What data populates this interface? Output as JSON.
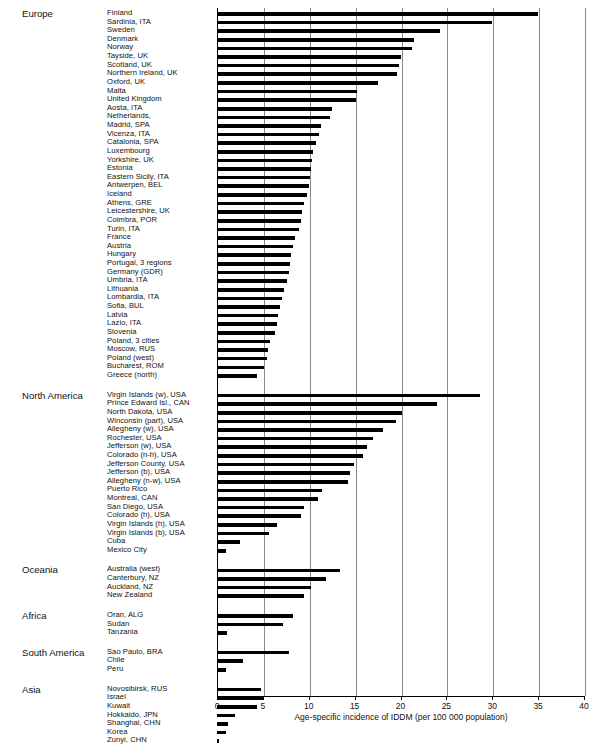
{
  "chart_data": {
    "type": "bar",
    "orientation": "horizontal",
    "title": "",
    "xlabel": "Age-specific incidence of IDDM (per 100 000 population)",
    "ylabel": "",
    "xlim": [
      0,
      40
    ],
    "xticks": [
      0,
      5,
      10,
      15,
      20,
      25,
      30,
      35,
      40
    ],
    "grid": true,
    "legend": null,
    "groups": [
      {
        "name": "Europe",
        "categories": [
          "Finland",
          "Sardinia, ITA",
          "Sweden",
          "Denmark",
          "Norway",
          "Tayside, UK",
          "Scotland, UK",
          "Northern Ireland, UK",
          "Oxford, UK",
          "Malta",
          "United Kingdom",
          "Aosta, ITA",
          "Netherlands,",
          "Madrid, SPA",
          "Vicenza, ITA",
          "Catalonia, SPA",
          "Luxembourg",
          "Yorkshire, UK",
          "Estonia",
          "Eastern Sicily, ITA",
          "Antwerpen, BEL",
          "Iceland",
          "Athens, GRE",
          "Leicestershire, UK",
          "Coimbra, POR",
          "Turin, ITA",
          "France",
          "Austria",
          "Hungary",
          "Portugal, 3 regions",
          "Germany (GDR)",
          "Umbria, ITA",
          "Lithuania",
          "Lombardia, ITA",
          "Sofia, BUL",
          "Latvia",
          "Lazio, ITA",
          "Slovenia",
          "Poland, 3 cities",
          "Moscow, RUS",
          "Poland (west)",
          "Bucharest, ROM",
          "Greece (north)"
        ],
        "values": [
          35.0,
          30.0,
          24.3,
          21.5,
          21.2,
          20.0,
          19.8,
          19.6,
          17.5,
          15.3,
          15.1,
          12.5,
          12.3,
          11.3,
          11.1,
          10.8,
          10.5,
          10.3,
          10.2,
          10.1,
          10.0,
          9.8,
          9.5,
          9.3,
          9.2,
          8.9,
          8.5,
          8.3,
          8.1,
          8.0,
          7.9,
          7.6,
          7.3,
          7.1,
          6.9,
          6.7,
          6.5,
          6.3,
          5.8,
          5.6,
          5.4,
          5.1,
          4.4
        ]
      },
      {
        "name": "North America",
        "categories": [
          "Virgin Islands (w), USA",
          "Prince Edward Isl., CAN",
          "North Dakota, USA",
          "Winconsin (part), USA",
          "Allegheny (w), USA",
          "Rochester, USA",
          "Jefferson (w), USA",
          "Colorado (n-h), USA",
          "Jefferson County, USA",
          "Jefferson (b), USA",
          "Allegheny (n-w), USA",
          "Puerto Rico",
          "Montreal, CAN",
          "San Diego, USA",
          "Colorado (h), USA",
          "Virgin Islands (h), USA",
          "Virgin Islands (b), USA",
          "Cuba",
          "Mexico City"
        ],
        "values": [
          28.7,
          24.0,
          20.2,
          19.5,
          18.1,
          17.0,
          16.4,
          15.9,
          14.9,
          14.5,
          14.3,
          11.4,
          11.0,
          9.5,
          9.2,
          6.5,
          5.7,
          2.5,
          1.0
        ]
      },
      {
        "name": "Oceania",
        "categories": [
          "Australia (west)",
          "Canterbury, NZ",
          "Auckland, NZ",
          "New Zealand"
        ],
        "values": [
          13.4,
          11.9,
          10.2,
          9.5
        ]
      },
      {
        "name": "Africa",
        "categories": [
          "Oran, ALG",
          "Sudan",
          "Tanzania"
        ],
        "values": [
          8.3,
          7.2,
          1.1
        ]
      },
      {
        "name": "South America",
        "categories": [
          "Sao Paulo, BRA",
          "Chile",
          "Peru"
        ],
        "values": [
          7.8,
          2.8,
          1.0
        ]
      },
      {
        "name": "Asia",
        "categories": [
          "Novosibirsk, RUS",
          "Israel",
          "Kuwait",
          "Hokkaido, JPN",
          "Shanghai, CHN",
          "Korea",
          "Zunyi, CHN"
        ],
        "values": [
          4.8,
          5.1,
          4.4,
          2.0,
          1.2,
          1.0,
          0.1
        ]
      }
    ]
  },
  "axis": {
    "tick_labels": [
      "0",
      "5",
      "10",
      "15",
      "20",
      "25",
      "30",
      "35",
      "40"
    ],
    "title": "Age-specific incidence of IDDM (per 100 000 population)"
  },
  "style": {
    "bar_color": "#000000",
    "grid_color": "#8a8a8a",
    "background": "#ffffff"
  }
}
